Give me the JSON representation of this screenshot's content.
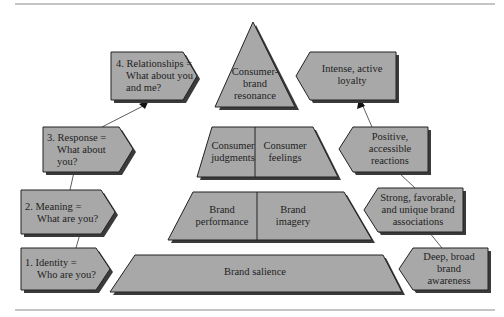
{
  "colors": {
    "fill": "#a8a8a8",
    "stroke": "#222222",
    "shadow": "#3a3a3a",
    "rule": "#888888",
    "text": "#1e1e1e"
  },
  "pyramid": {
    "apex": {
      "line1": "Consumer-",
      "line2": "brand",
      "line3": "resonance"
    },
    "tier3": {
      "left": {
        "line1": "Consumer",
        "line2": "judgments"
      },
      "right": {
        "line1": "Consumer",
        "line2": "feelings"
      }
    },
    "tier2": {
      "left": {
        "line1": "Brand",
        "line2": "performance"
      },
      "right": {
        "line1": "Brand",
        "line2": "imagery"
      }
    },
    "tier1": {
      "line1": "Brand salience"
    }
  },
  "stages": [
    {
      "line1": "1. Identity =",
      "line2": "Who are you?"
    },
    {
      "line1": "2. Meaning =",
      "line2": "What are you?"
    },
    {
      "line1": "3. Response =",
      "line2": "What about",
      "line3": "you?"
    },
    {
      "line1": "4. Relationships =",
      "line2": "What about you",
      "line3": "and me?"
    }
  ],
  "objectives": [
    {
      "line1": "Deep, broad",
      "line2": "brand",
      "line3": "awareness"
    },
    {
      "line1": "Strong, favorable,",
      "line2": "and unique brand",
      "line3": "associations"
    },
    {
      "line1": "Positive,",
      "line2": "accessible",
      "line3": "reactions"
    },
    {
      "line1": "Intense, active",
      "line2": "loyalty"
    }
  ]
}
